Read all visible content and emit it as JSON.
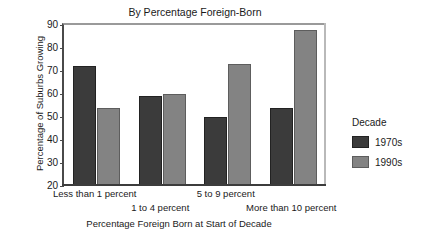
{
  "chart_data": {
    "type": "bar",
    "title": "By Percentage Foreign-Born",
    "xlabel": "Percentage Foreign Born at Start of Decade",
    "ylabel": "Percentage of Suburbs Growing",
    "categories": [
      "Less than 1 percent",
      "1 to 4 percent",
      "5 to 9 percent",
      "More than 10 percent"
    ],
    "series": [
      {
        "name": "1970s",
        "color": "#3b3b3b",
        "values": [
          72,
          59,
          50,
          54
        ]
      },
      {
        "name": "1990s",
        "color": "#838383",
        "values": [
          54,
          60,
          73,
          88
        ]
      }
    ],
    "ylim": [
      20,
      90
    ],
    "yticks": [
      20,
      30,
      40,
      50,
      60,
      70,
      80,
      90
    ],
    "ytick_labels": [
      "20",
      "30",
      "40",
      "50",
      "60",
      "70",
      "80",
      "90"
    ],
    "grid": false,
    "legend": {
      "title": "Decade",
      "position": "right",
      "entries": [
        "1970s",
        "1990s"
      ]
    }
  },
  "legend": {
    "title": "Decade",
    "items": [
      {
        "label": "1970s"
      },
      {
        "label": "1990s"
      }
    ]
  },
  "axes": {
    "y_title": "Percentage of Suburbs Growing",
    "x_title": "Percentage Foreign Born at Start of Decade"
  },
  "colors": {
    "series_1970s": "#3b3b3b",
    "series_1990s": "#838383",
    "axis": "#3c3c3c",
    "background": "#ffffff"
  }
}
